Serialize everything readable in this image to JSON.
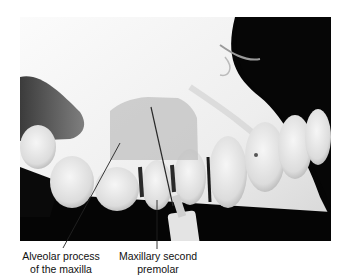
{
  "figure": {
    "colors": {
      "background": "#ffffff",
      "photo_background": "#050505",
      "overlay_region": "#c9c9c9",
      "label_text": "#111111",
      "leader_line": "#222222"
    },
    "labels": [
      {
        "id": "alveolar",
        "line1": "Alveolar process",
        "line2": "of the maxilla"
      },
      {
        "id": "premolar",
        "line1": "Maxillary second",
        "line2": "premolar"
      }
    ]
  }
}
